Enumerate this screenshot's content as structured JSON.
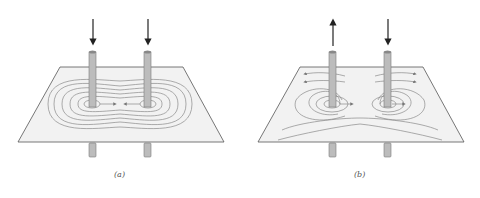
{
  "figure": {
    "panels": [
      {
        "id": "a",
        "label": "(a)",
        "description": "Two parallel wires with currents in same direction (both into plane)",
        "wire_left_current": "down",
        "wire_right_current": "down"
      },
      {
        "id": "b",
        "label": "(b)",
        "description": "Two parallel wires with currents in opposite directions",
        "wire_left_current": "up",
        "wire_right_current": "down"
      }
    ],
    "colors": {
      "plane": "#f2f2f2",
      "plane_edge": "#555555",
      "wire": "#bcbcbc",
      "wire_edge": "#7a7a7a",
      "field_line": "#8a8a8a",
      "arrow": "#333333"
    }
  }
}
